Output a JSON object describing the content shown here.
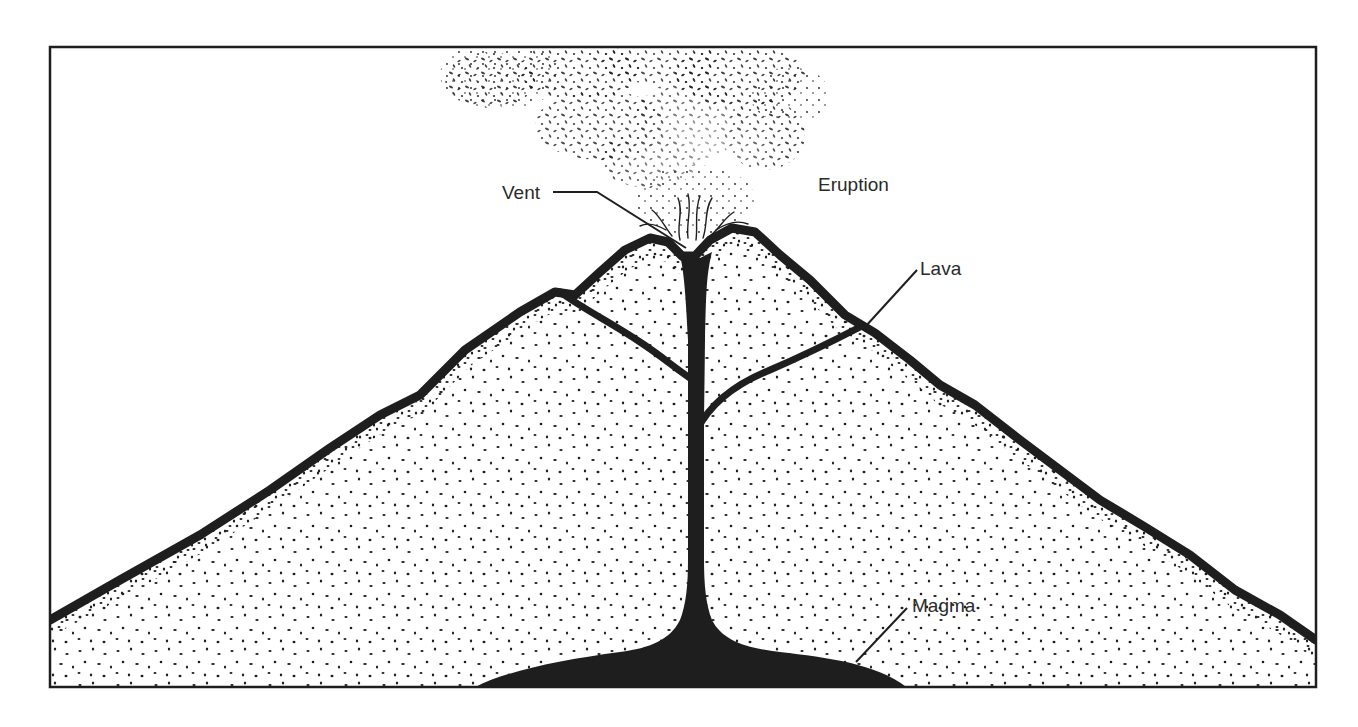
{
  "diagram": {
    "labels": {
      "vent": "Vent",
      "eruption": "Eruption",
      "lava": "Lava",
      "magma": "Magma"
    },
    "colors": {
      "ink": "#1e1e1e",
      "paper": "#ffffff",
      "label_text": "#2a2a2a"
    }
  }
}
